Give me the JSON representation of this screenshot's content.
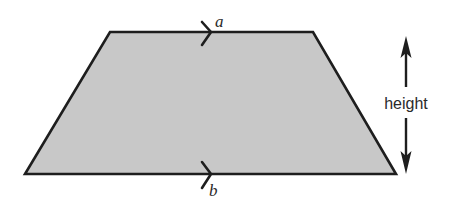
{
  "diagram": {
    "shape": "trapezoid",
    "colors": {
      "fill": "#c8c8c8",
      "stroke": "#1e1e1e",
      "background": "#ffffff",
      "text": "#2a2a2a"
    },
    "vertices": {
      "top_left": [
        110,
        32
      ],
      "top_right": [
        313,
        32
      ],
      "bottom_right": [
        396,
        174
      ],
      "bottom_left": [
        25,
        174
      ]
    },
    "labels": {
      "top_side": "a",
      "bottom_side": "b",
      "height": "height"
    },
    "parallel_markers": {
      "top": "single-chevron",
      "bottom": "single-chevron"
    },
    "height_arrow": {
      "type": "double-headed-vertical",
      "x": 406,
      "y_top": 37,
      "y_bottom": 173
    }
  }
}
